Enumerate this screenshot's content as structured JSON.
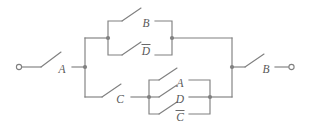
{
  "diagram": {
    "type": "switching-circuit",
    "line_color": "#808080",
    "label_color": "#595959",
    "background": "#ffffff",
    "terminals": [
      {
        "name": "left-terminal",
        "x": 18,
        "y": 67
      },
      {
        "name": "right-terminal",
        "x": 292,
        "y": 67
      }
    ],
    "nodes": [
      {
        "name": "left-bus-node",
        "x": 85,
        "y": 67
      },
      {
        "name": "upper-block-left-node",
        "x": 108,
        "y": 38
      },
      {
        "name": "upper-block-right-node",
        "x": 172,
        "y": 38
      },
      {
        "name": "lower-block-left-node",
        "x": 149,
        "y": 97
      },
      {
        "name": "lower-block-right-node",
        "x": 210,
        "y": 97
      },
      {
        "name": "right-bus-node",
        "x": 232,
        "y": 67
      }
    ],
    "switches": [
      {
        "id": "sw-a-input",
        "label": "A",
        "negated": false,
        "label_x": 62,
        "label_y": 70
      },
      {
        "id": "sw-b-upper",
        "label": "B",
        "negated": false,
        "label_x": 146,
        "label_y": 24
      },
      {
        "id": "sw-d-upper",
        "label": "D",
        "negated": true,
        "label_x": 146,
        "label_y": 52
      },
      {
        "id": "sw-c-lower",
        "label": "C",
        "negated": false,
        "label_x": 120,
        "label_y": 100
      },
      {
        "id": "sw-a-block",
        "label": "A",
        "negated": false,
        "label_x": 180,
        "label_y": 84
      },
      {
        "id": "sw-d-block",
        "label": "D",
        "negated": false,
        "label_x": 180,
        "label_y": 100
      },
      {
        "id": "sw-c-block",
        "label": "C",
        "negated": true,
        "label_x": 180,
        "label_y": 118
      },
      {
        "id": "sw-b-output",
        "label": "B",
        "negated": false,
        "label_x": 266,
        "label_y": 70
      }
    ]
  }
}
